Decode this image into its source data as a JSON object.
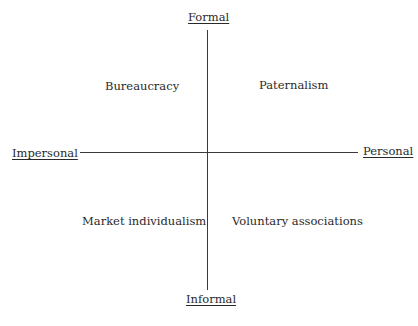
{
  "diagram": {
    "type": "quadrant",
    "axes": {
      "vertical": {
        "top": "Formal",
        "bottom": "Informal"
      },
      "horizontal": {
        "left": "Impersonal",
        "right": "Personal"
      }
    },
    "quadrants": {
      "top_left": "Bureaucracy",
      "top_right": "Paternalism",
      "bottom_left": "Market individualism",
      "bottom_right": "Voluntary associations"
    }
  }
}
